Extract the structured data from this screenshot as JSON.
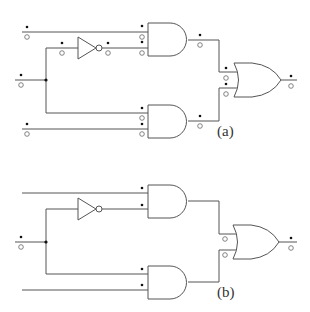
{
  "diagrams": [
    {
      "id": "a",
      "label": "(a)",
      "description": "Logic circuit with AND-OR structure and one inverter, annotated with probe markers (filled dot and hollow circle) on every wire",
      "gates": [
        {
          "type": "NOT",
          "name": "inverter"
        },
        {
          "type": "AND",
          "name": "and-top"
        },
        {
          "type": "AND",
          "name": "and-bottom"
        },
        {
          "type": "OR",
          "name": "or-output"
        }
      ],
      "markers": "dot-and-circle on all inputs/outputs"
    },
    {
      "id": "b",
      "label": "(b)",
      "description": "Same logic circuit with markers partially removed: only dots at AND inputs, circles at OR inputs, dot-and-circle at primary input and output",
      "gates": [
        {
          "type": "NOT",
          "name": "inverter"
        },
        {
          "type": "AND",
          "name": "and-top"
        },
        {
          "type": "AND",
          "name": "and-bottom"
        },
        {
          "type": "OR",
          "name": "or-output"
        }
      ],
      "markers": "reduced set"
    }
  ],
  "colors": {
    "wire": "#555555",
    "dot": "#111111",
    "background": "#ffffff"
  }
}
